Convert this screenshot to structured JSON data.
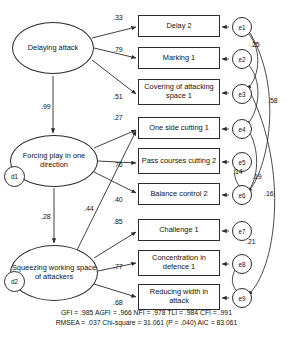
{
  "diagram": {
    "type": "sem-path-diagram",
    "latents": [
      {
        "id": "F1",
        "label": "Delaying attack",
        "x": 12,
        "y": 22,
        "w": 82,
        "h": 52
      },
      {
        "id": "F2",
        "label": "Forcing play in one direction",
        "x": 10,
        "y": 135,
        "w": 88,
        "h": 52
      },
      {
        "id": "F3",
        "label": "Squeezing working space of attackers",
        "x": 10,
        "y": 245,
        "w": 88,
        "h": 56
      }
    ],
    "disturbances": [
      {
        "id": "d1",
        "label": "d1",
        "x": 4,
        "y": 177,
        "r": 11
      },
      {
        "id": "d2",
        "label": "d2",
        "x": 4,
        "y": 282,
        "r": 11
      }
    ],
    "indicators": [
      {
        "id": "Y1",
        "label": "Delay 2",
        "x": 138,
        "y": 15,
        "w": 82,
        "h": 22
      },
      {
        "id": "Y2",
        "label": "Marking 1",
        "x": 138,
        "y": 47,
        "w": 82,
        "h": 22
      },
      {
        "id": "Y3",
        "label": "Covering of attacking space 1",
        "x": 138,
        "y": 79,
        "w": 82,
        "h": 26
      },
      {
        "id": "Y4",
        "label": "One side cutting 1",
        "x": 138,
        "y": 117,
        "w": 82,
        "h": 22
      },
      {
        "id": "Y5",
        "label": "Pass courses cutting 2",
        "x": 138,
        "y": 148,
        "w": 82,
        "h": 26
      },
      {
        "id": "Y6",
        "label": "Balance control 2",
        "x": 138,
        "y": 183,
        "w": 82,
        "h": 22
      },
      {
        "id": "Y7",
        "label": "Challenge 1",
        "x": 138,
        "y": 219,
        "w": 82,
        "h": 22
      },
      {
        "id": "Y8",
        "label": "Concentration in defence 1",
        "x": 138,
        "y": 250,
        "w": 82,
        "h": 26
      },
      {
        "id": "Y9",
        "label": "Reducing width in attack",
        "x": 138,
        "y": 284,
        "w": 82,
        "h": 26
      }
    ],
    "errors": [
      {
        "id": "e1",
        "label": "e1",
        "x": 232,
        "y": 17
      },
      {
        "id": "e2",
        "label": "e2",
        "x": 232,
        "y": 49
      },
      {
        "id": "e3",
        "label": "e3",
        "x": 232,
        "y": 84
      },
      {
        "id": "e4",
        "label": "e4",
        "x": 232,
        "y": 119
      },
      {
        "id": "e5",
        "label": "e5",
        "x": 232,
        "y": 152
      },
      {
        "id": "e6",
        "label": "e6",
        "x": 232,
        "y": 185
      },
      {
        "id": "e7",
        "label": "e7",
        "x": 232,
        "y": 221
      },
      {
        "id": "e8",
        "label": "e8",
        "x": 232,
        "y": 254
      },
      {
        "id": "e9",
        "label": "e9",
        "x": 232,
        "y": 288
      }
    ],
    "loadings": [
      {
        "from": "F1",
        "to": "Y1",
        "value": ".33",
        "x": 113,
        "y": 14
      },
      {
        "from": "F1",
        "to": "Y2",
        "value": ".79",
        "x": 113,
        "y": 46
      },
      {
        "from": "F1",
        "to": "Y3",
        "value": ".51",
        "x": 113,
        "y": 93
      },
      {
        "from": "F2",
        "to": "Y4",
        "value": ".27",
        "x": 113,
        "y": 114
      },
      {
        "from": "F2",
        "to": "Y5",
        "value": ".76",
        "x": 113,
        "y": 161
      },
      {
        "from": "F2",
        "to": "Y6",
        "value": ".40",
        "x": 113,
        "y": 196
      },
      {
        "from": "F3",
        "to": "Y7",
        "value": ".85",
        "x": 113,
        "y": 218
      },
      {
        "from": "F3",
        "to": "Y8",
        "value": ".77",
        "x": 113,
        "y": 263
      },
      {
        "from": "F3",
        "to": "Y9",
        "value": ".68",
        "x": 113,
        "y": 299
      }
    ],
    "structural_paths": [
      {
        "from": "F1",
        "to": "F2",
        "value": ".99",
        "x": 41,
        "y": 103
      },
      {
        "from": "F2",
        "to": "F3",
        "value": ".28",
        "x": 41,
        "y": 213
      },
      {
        "from": "F2",
        "to": "Y4",
        "value": ".44",
        "x": 84,
        "y": 205
      }
    ],
    "correlations": [
      {
        "between": "e1-e3",
        "value": ".25",
        "x": 250,
        "y": 41
      },
      {
        "between": "e1-e6",
        "value": ".58",
        "x": 268,
        "y": 97
      },
      {
        "between": "e5-e6",
        "value": ".14",
        "x": 233,
        "y": 168
      },
      {
        "between": "e4-e6",
        "value": ".19",
        "x": 252,
        "y": 173
      },
      {
        "between": "e3-e9",
        "value": ".16",
        "x": 264,
        "y": 190
      },
      {
        "between": "e6-e8",
        "value": ".21",
        "x": 246,
        "y": 238
      }
    ]
  },
  "fit_statistics": {
    "line1": "GFI = .985 AGFI = .966 NFI = .978 TLI = .984 CFI = .991",
    "line2": "RMSEA = .037 Chi-square = 31.061 (P = .040) AIC = 83.061",
    "values": {
      "GFI": ".985",
      "AGFI": ".966",
      "NFI": ".978",
      "TLI": ".984",
      "CFI": ".991",
      "RMSEA": ".037",
      "Chi_square": "31.061",
      "P": ".040",
      "AIC": "83.061"
    }
  }
}
